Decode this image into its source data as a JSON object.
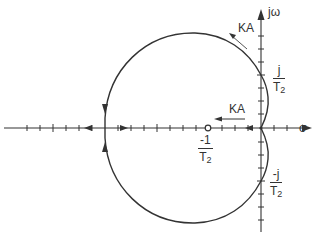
{
  "diagram": {
    "type": "root-locus",
    "axes": {
      "real_axis_label": "σ",
      "imag_axis_label": "jω"
    },
    "gain_labels": {
      "upper_branch": "KA",
      "real_axis": "KA"
    },
    "markers": {
      "zero": {
        "label_num": "-1",
        "label_den": "T",
        "label_den_sub": "2"
      },
      "imag_crossing_upper": {
        "label_num": "j",
        "label_den": "T",
        "label_den_sub": "2"
      },
      "imag_crossing_lower": {
        "label_num": "-j",
        "label_den": "T",
        "label_den_sub": "2"
      }
    },
    "colors": {
      "line": "#333333",
      "background": "#ffffff"
    }
  }
}
